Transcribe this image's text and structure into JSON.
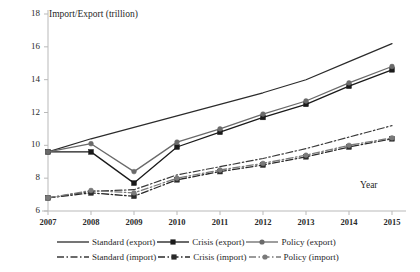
{
  "chart_data": {
    "type": "line",
    "title": "",
    "ylabel": "Import/Export (trillion)",
    "xlabel": "Year",
    "x": [
      2007,
      2008,
      2009,
      2010,
      2011,
      2012,
      2013,
      2014,
      2015
    ],
    "categories": [
      "2007",
      "2008",
      "2009",
      "2010",
      "2011",
      "2012",
      "2013",
      "2014",
      "2015"
    ],
    "ylim": [
      6,
      18
    ],
    "xlim": [
      2007,
      2015
    ],
    "yticks": [
      6,
      8,
      10,
      12,
      14,
      16,
      18
    ],
    "grid": false,
    "legend_position": "bottom",
    "series": [
      {
        "name": "Standard (export)",
        "style": "solid",
        "marker": "none",
        "color": "#2b2b2b",
        "values": [
          9.6,
          10.4,
          11.1,
          11.8,
          12.5,
          13.2,
          14.0,
          15.1,
          16.2
        ]
      },
      {
        "name": "Crisis (export)",
        "style": "solid",
        "marker": "square",
        "color": "#1a1a1a",
        "values": [
          9.6,
          9.6,
          7.7,
          9.9,
          10.8,
          11.7,
          12.5,
          13.6,
          14.6
        ]
      },
      {
        "name": "Policy (export)",
        "style": "solid",
        "marker": "circle",
        "color": "#6a6a6a",
        "values": [
          9.6,
          10.1,
          8.4,
          10.2,
          11.0,
          11.9,
          12.7,
          13.8,
          14.8
        ]
      },
      {
        "name": "Standard (import)",
        "style": "dashdot",
        "marker": "none",
        "color": "#3a3a3a",
        "values": [
          6.8,
          7.2,
          7.3,
          8.2,
          8.7,
          9.2,
          9.8,
          10.5,
          11.2
        ]
      },
      {
        "name": "Crisis (import)",
        "style": "dashdot",
        "marker": "square",
        "color": "#2a2a2a",
        "values": [
          6.8,
          7.1,
          6.9,
          7.9,
          8.4,
          8.8,
          9.3,
          9.9,
          10.4
        ]
      },
      {
        "name": "Policy (import)",
        "style": "dashdot",
        "marker": "circle",
        "color": "#7a7a7a",
        "values": [
          6.8,
          7.25,
          7.1,
          8.0,
          8.5,
          8.9,
          9.4,
          10.0,
          10.45
        ]
      }
    ]
  },
  "legend": {
    "row1": [
      {
        "label": "Standard (export)"
      },
      {
        "label": "Crisis (export)"
      },
      {
        "label": "Policy (export)"
      }
    ],
    "row2": [
      {
        "label": "Standard (import)"
      },
      {
        "label": "Crisis (import)"
      },
      {
        "label": "Policy (import)"
      }
    ]
  }
}
